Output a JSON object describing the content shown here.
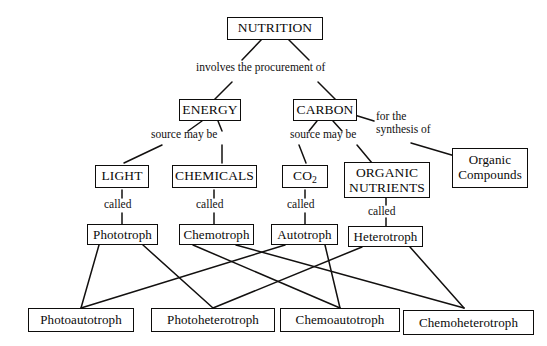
{
  "diagram": {
    "title_node": "NUTRITION",
    "nodes": {
      "nutrition": "NUTRITION",
      "energy": "ENERGY",
      "carbon": "CARBON",
      "light": "LIGHT",
      "chemicals": "CHEMICALS",
      "co2_prefix": "CO",
      "co2_sub": "2",
      "organic_nutrients_line1": "ORGANIC",
      "organic_nutrients_line2": "NUTRIENTS",
      "organic_compounds_line1": "Organic",
      "organic_compounds_line2": "Compounds",
      "phototroph": "Phototroph",
      "chemotroph": "Chemotroph",
      "autotroph": "Autotroph",
      "heterotroph": "Heterotroph",
      "photoautotroph": "Photoautotroph",
      "photoheterotroph": "Photoheterotroph",
      "chemoautotroph": "Chemoautotroph",
      "chemoheterotroph": "Chemoheterotroph"
    },
    "link_labels": {
      "involves": "involves the procurement of",
      "source_energy": "source may be",
      "source_carbon": "source may be",
      "synthesis_line1": "for the",
      "synthesis_line2": "synthesis of",
      "called_light": "called",
      "called_chemicals": "called",
      "called_co2": "called",
      "called_organic": "called"
    },
    "colors": {
      "stroke": "#12100f",
      "background": "#ffffff",
      "text": "#0a0a0a"
    }
  }
}
